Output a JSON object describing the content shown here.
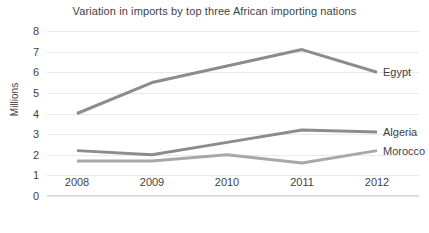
{
  "chart_data": {
    "type": "line",
    "title": "Variation in imports by top three African importing nations",
    "xlabel": "",
    "ylabel": "Millions",
    "categories": [
      "2008",
      "2009",
      "2010",
      "2011",
      "2012"
    ],
    "ylim": [
      0,
      8
    ],
    "yticks": [
      "0",
      "1",
      "2",
      "3",
      "4",
      "5",
      "6",
      "7",
      "8"
    ],
    "grid": true,
    "legend_position": "inline-right",
    "series": [
      {
        "name": "Egypt",
        "values": [
          4.0,
          5.5,
          6.3,
          7.1,
          6.0
        ],
        "color": "#8c8c8c"
      },
      {
        "name": "Algeria",
        "values": [
          2.2,
          2.0,
          2.6,
          3.2,
          3.1
        ],
        "color": "#8c8c8c"
      },
      {
        "name": "Morocco",
        "values": [
          1.7,
          1.7,
          2.0,
          1.6,
          2.2
        ],
        "color": "#a8a8a8"
      }
    ]
  }
}
